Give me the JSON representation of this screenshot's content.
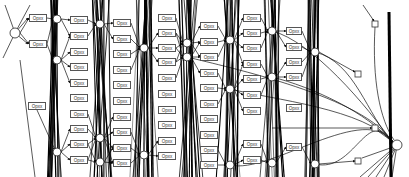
{
  "diagram": {
    "type": "operation-flow-graph",
    "colors": {
      "background": "#ffffff",
      "edge": "#111111",
      "node_border": "#555555",
      "label_text": "#333333"
    },
    "label_nodes": [
      {
        "label": "Opxx",
        "x": 29,
        "y": 14,
        "w": 18
      },
      {
        "label": "Opxx",
        "x": 29,
        "y": 40,
        "w": 18
      },
      {
        "label": "Opxx",
        "x": 28,
        "y": 102,
        "w": 18
      },
      {
        "label": "Opxx",
        "x": 70,
        "y": 16,
        "w": 18
      },
      {
        "label": "Opxx",
        "x": 70,
        "y": 32,
        "w": 18
      },
      {
        "label": "Opxx",
        "x": 70,
        "y": 48,
        "w": 18
      },
      {
        "label": "Opxx",
        "x": 70,
        "y": 63,
        "w": 18
      },
      {
        "label": "Opxx",
        "x": 70,
        "y": 79,
        "w": 18
      },
      {
        "label": "Opxx",
        "x": 70,
        "y": 94,
        "w": 18
      },
      {
        "label": "Opxx",
        "x": 70,
        "y": 110,
        "w": 18
      },
      {
        "label": "Opxx",
        "x": 70,
        "y": 125,
        "w": 18
      },
      {
        "label": "Opxx",
        "x": 70,
        "y": 140,
        "w": 18
      },
      {
        "label": "Opxx",
        "x": 70,
        "y": 156,
        "w": 18
      },
      {
        "label": "Opxx",
        "x": 113,
        "y": 19,
        "w": 18
      },
      {
        "label": "Opxx",
        "x": 113,
        "y": 35,
        "w": 18
      },
      {
        "label": "Opxx",
        "x": 113,
        "y": 50,
        "w": 18
      },
      {
        "label": "Opxx",
        "x": 113,
        "y": 66,
        "w": 18
      },
      {
        "label": "Opxx",
        "x": 113,
        "y": 81,
        "w": 18
      },
      {
        "label": "Opxx",
        "x": 113,
        "y": 97,
        "w": 18
      },
      {
        "label": "Opxx",
        "x": 113,
        "y": 113,
        "w": 18
      },
      {
        "label": "Opxx",
        "x": 113,
        "y": 128,
        "w": 18
      },
      {
        "label": "Opxx",
        "x": 113,
        "y": 144,
        "w": 18
      },
      {
        "label": "Opxx",
        "x": 113,
        "y": 159,
        "w": 18
      },
      {
        "label": "Opxx",
        "x": 158,
        "y": 14,
        "w": 18
      },
      {
        "label": "Opxx",
        "x": 158,
        "y": 29,
        "w": 18
      },
      {
        "label": "Opxx",
        "x": 158,
        "y": 44,
        "w": 18
      },
      {
        "label": "Opxx",
        "x": 158,
        "y": 58,
        "w": 18
      },
      {
        "label": "Opxx",
        "x": 158,
        "y": 74,
        "w": 18
      },
      {
        "label": "Opxx",
        "x": 158,
        "y": 90,
        "w": 18
      },
      {
        "label": "Opxx",
        "x": 158,
        "y": 106,
        "w": 18
      },
      {
        "label": "Opxx",
        "x": 158,
        "y": 121,
        "w": 18
      },
      {
        "label": "Opxx",
        "x": 158,
        "y": 137,
        "w": 18
      },
      {
        "label": "Opxx",
        "x": 158,
        "y": 152,
        "w": 18
      },
      {
        "label": "Opxx",
        "x": 200,
        "y": 22,
        "w": 18
      },
      {
        "label": "Opxx",
        "x": 200,
        "y": 38,
        "w": 18
      },
      {
        "label": "Opxx",
        "x": 200,
        "y": 53,
        "w": 18
      },
      {
        "label": "Opxx",
        "x": 200,
        "y": 69,
        "w": 18
      },
      {
        "label": "Opxx",
        "x": 200,
        "y": 84,
        "w": 18
      },
      {
        "label": "Opxx",
        "x": 200,
        "y": 100,
        "w": 18
      },
      {
        "label": "Opxx",
        "x": 200,
        "y": 115,
        "w": 18
      },
      {
        "label": "Opxx",
        "x": 200,
        "y": 131,
        "w": 18
      },
      {
        "label": "Opxx",
        "x": 200,
        "y": 146,
        "w": 18
      },
      {
        "label": "Opxx",
        "x": 200,
        "y": 161,
        "w": 18
      },
      {
        "label": "Opxx",
        "x": 243,
        "y": 14,
        "w": 18
      },
      {
        "label": "Opxx",
        "x": 243,
        "y": 29,
        "w": 18
      },
      {
        "label": "Opxx",
        "x": 243,
        "y": 44,
        "w": 18
      },
      {
        "label": "Opxx",
        "x": 243,
        "y": 60,
        "w": 18
      },
      {
        "label": "Opxx",
        "x": 243,
        "y": 75,
        "w": 18
      },
      {
        "label": "Opxx",
        "x": 243,
        "y": 91,
        "w": 18
      },
      {
        "label": "Opxx",
        "x": 243,
        "y": 107,
        "w": 18
      },
      {
        "label": "Opxx",
        "x": 243,
        "y": 140,
        "w": 18
      },
      {
        "label": "Opxx",
        "x": 243,
        "y": 156,
        "w": 18
      },
      {
        "label": "Opxx",
        "x": 286,
        "y": 27,
        "w": 16
      },
      {
        "label": "Opxx",
        "x": 286,
        "y": 43,
        "w": 16
      },
      {
        "label": "Opxx",
        "x": 286,
        "y": 58,
        "w": 16
      },
      {
        "label": "Opxx",
        "x": 286,
        "y": 73,
        "w": 16
      },
      {
        "label": "Opxx",
        "x": 286,
        "y": 104,
        "w": 16
      },
      {
        "label": "Opxx",
        "x": 286,
        "y": 143,
        "w": 16
      }
    ],
    "junction_nodes": [
      {
        "x": 15,
        "y": 33,
        "r": 5
      },
      {
        "x": 57,
        "y": 19,
        "r": 4
      },
      {
        "x": 57,
        "y": 60,
        "r": 4
      },
      {
        "x": 57,
        "y": 152,
        "r": 4
      },
      {
        "x": 100,
        "y": 24,
        "r": 4
      },
      {
        "x": 100,
        "y": 138,
        "r": 4
      },
      {
        "x": 100,
        "y": 162,
        "r": 4
      },
      {
        "x": 144,
        "y": 48,
        "r": 4
      },
      {
        "x": 144,
        "y": 155,
        "r": 4
      },
      {
        "x": 187,
        "y": 43,
        "r": 4
      },
      {
        "x": 187,
        "y": 57,
        "r": 4
      },
      {
        "x": 230,
        "y": 40,
        "r": 4
      },
      {
        "x": 230,
        "y": 89,
        "r": 4
      },
      {
        "x": 230,
        "y": 165,
        "r": 4
      },
      {
        "x": 272,
        "y": 31,
        "r": 4
      },
      {
        "x": 272,
        "y": 77,
        "r": 4
      },
      {
        "x": 272,
        "y": 163,
        "r": 4
      },
      {
        "x": 315,
        "y": 52,
        "r": 4
      },
      {
        "x": 315,
        "y": 164,
        "r": 4
      },
      {
        "x": 397,
        "y": 145,
        "r": 5
      }
    ],
    "square_nodes": [
      {
        "x": 375,
        "y": 24,
        "s": 6
      },
      {
        "x": 358,
        "y": 74,
        "s": 6
      },
      {
        "x": 375,
        "y": 128,
        "s": 6
      },
      {
        "x": 358,
        "y": 161,
        "s": 6
      }
    ]
  }
}
